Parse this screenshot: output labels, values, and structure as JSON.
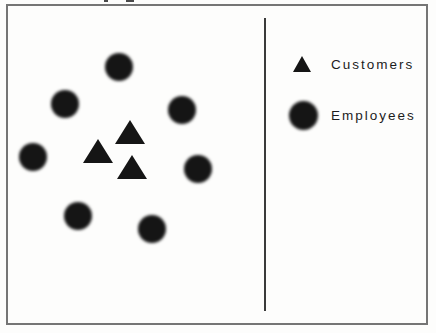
{
  "figure": {
    "legend": {
      "items": [
        {
          "symbol": "triangle",
          "label": "Customers"
        },
        {
          "symbol": "circle",
          "label": "Employees"
        }
      ]
    },
    "diagram": {
      "customers": {
        "symbol": "triangle",
        "color": "#151515",
        "width": 30,
        "height": 24,
        "points": [
          {
            "x": 130,
            "y": 132
          },
          {
            "x": 98,
            "y": 151
          },
          {
            "x": 132,
            "y": 167
          }
        ]
      },
      "employees": {
        "symbol": "circle",
        "color": "#151515",
        "diameter": 28,
        "points": [
          {
            "x": 119,
            "y": 67
          },
          {
            "x": 65,
            "y": 104
          },
          {
            "x": 182,
            "y": 110
          },
          {
            "x": 33,
            "y": 157
          },
          {
            "x": 198,
            "y": 169
          },
          {
            "x": 78,
            "y": 216
          },
          {
            "x": 152,
            "y": 229
          }
        ]
      },
      "divider_color": "#3a3a3a",
      "frame_border_color": "#757575"
    },
    "caption_fragments": [
      {
        "x": 104,
        "width": 4
      },
      {
        "x": 126,
        "width": 8
      }
    ]
  }
}
